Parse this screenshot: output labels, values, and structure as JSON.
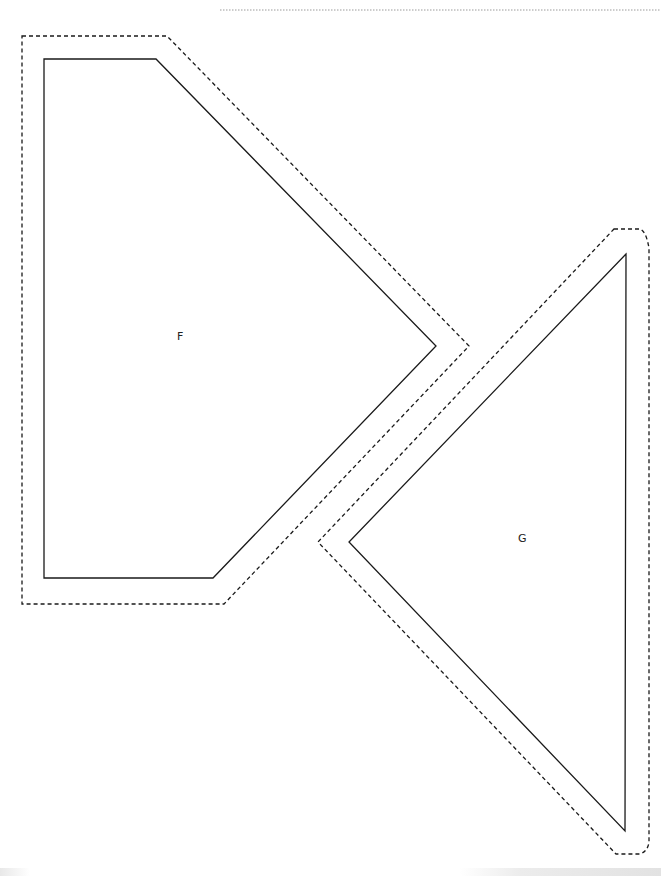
{
  "page": {
    "type": "printable pattern template",
    "background": "#ffffff"
  },
  "pieces": [
    {
      "id": "F",
      "label": "F",
      "shape": "pentagon",
      "cut_line": "solid",
      "seam_allowance_line": "dashed",
      "stroke_color": "#1a1a1a",
      "inner_points": [
        [
          44,
          59
        ],
        [
          156,
          59
        ],
        [
          436,
          346
        ],
        [
          213,
          578
        ],
        [
          44,
          578
        ]
      ],
      "outer_points": [
        [
          22,
          36
        ],
        [
          167,
          36
        ],
        [
          469,
          346
        ],
        [
          224,
          604
        ],
        [
          22,
          604
        ]
      ]
    },
    {
      "id": "G",
      "label": "G",
      "shape": "triangle",
      "cut_line": "solid",
      "seam_allowance_line": "dashed",
      "stroke_color": "#1a1a1a",
      "inner_points": [
        [
          626,
          254
        ],
        [
          349,
          542
        ],
        [
          625,
          831
        ]
      ],
      "outer_points": [
        [
          614,
          229
        ],
        [
          640,
          229
        ],
        [
          649,
          248
        ],
        [
          649,
          842
        ],
        [
          640,
          854
        ],
        [
          616,
          854
        ],
        [
          318,
          542
        ]
      ]
    }
  ],
  "top_rule": {
    "style": "dotted",
    "x1": 220,
    "x2": 661,
    "y": 10,
    "color": "#9a9a9a"
  }
}
